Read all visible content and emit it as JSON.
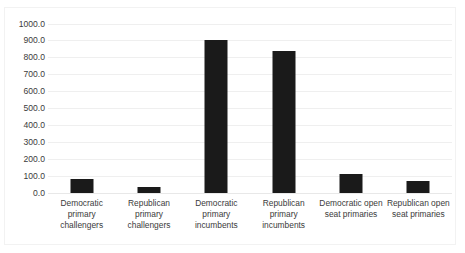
{
  "chart_data": {
    "type": "bar",
    "title": "",
    "subtitle": "",
    "xlabel": "",
    "ylabel": "",
    "grid": true,
    "legend": false,
    "ylim": [
      0,
      1000
    ],
    "ytick_step": 100,
    "ytick_labels": [
      "1000.0",
      "900.0",
      "800.0",
      "700.0",
      "600.0",
      "500.0",
      "400.0",
      "300.0",
      "200.0",
      "100.0",
      "0.0"
    ],
    "ytick_values": [
      1000,
      900,
      800,
      700,
      600,
      500,
      400,
      300,
      200,
      100,
      0
    ],
    "categories": [
      "Democratic primary challengers",
      "Republican primary challengers",
      "Democratic primary incumbents",
      "Republican primary incumbents",
      "Democratic open seat primaries",
      "Republican open seat primaries"
    ],
    "category_lines": [
      [
        "Democratic",
        "primary",
        "challengers"
      ],
      [
        "Republican",
        "primary",
        "challengers"
      ],
      [
        "Democratic",
        "primary",
        "incumbents"
      ],
      [
        "Republican",
        "primary",
        "incumbents"
      ],
      [
        "Democratic open",
        "seat primaries"
      ],
      [
        "Republican open",
        "seat primaries"
      ]
    ],
    "values": [
      80,
      35,
      900,
      840,
      115,
      70
    ],
    "bar_color": "#1a1a1a",
    "grid_color": "#efefef",
    "text_color": "#3b3b3b",
    "background_color": "#ffffff"
  }
}
